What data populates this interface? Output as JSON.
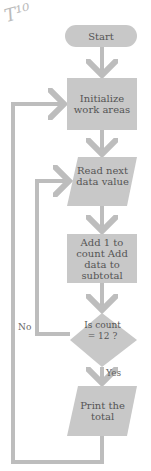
{
  "annotation": "T¹⁰",
  "colors": {
    "shape_fill": "#c8c8c8",
    "connector": "#bdbdbd",
    "text": "#555555"
  },
  "nodes": [
    {
      "id": "start",
      "type": "terminator",
      "label": "Start"
    },
    {
      "id": "init",
      "type": "process",
      "label": "Initialize work areas"
    },
    {
      "id": "read",
      "type": "input",
      "label": "Read next data value"
    },
    {
      "id": "add",
      "type": "process",
      "label": "Add 1 to count Add data to subtotal"
    },
    {
      "id": "decision",
      "type": "decision",
      "label": "Is count = 12 ?"
    },
    {
      "id": "print",
      "type": "output",
      "label": "Print the total"
    }
  ],
  "edges": {
    "no_label": "No",
    "yes_label": "Yes"
  }
}
